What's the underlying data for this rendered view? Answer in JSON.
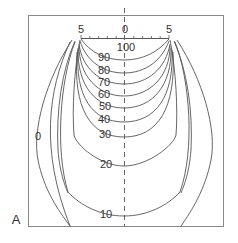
{
  "figure": {
    "panel_label": "A",
    "type": "isodose curve diagram",
    "ruler": {
      "left_label": "5",
      "center_label": "0",
      "right_label": "5",
      "tick_count": 11
    },
    "isodose_labels": {
      "l100": "100",
      "l90": "90",
      "l80": "80",
      "l70": "70",
      "l60": "60",
      "l50": "50",
      "l40": "40",
      "l30": "30",
      "l20": "20",
      "l10": "10",
      "l0": "0"
    },
    "isodose_levels": [
      100,
      90,
      80,
      70,
      60,
      50,
      40,
      30,
      20,
      10,
      0
    ],
    "colors": {
      "line": "#555555",
      "frame": "#888888",
      "text": "#333333",
      "background": "#ffffff"
    }
  }
}
